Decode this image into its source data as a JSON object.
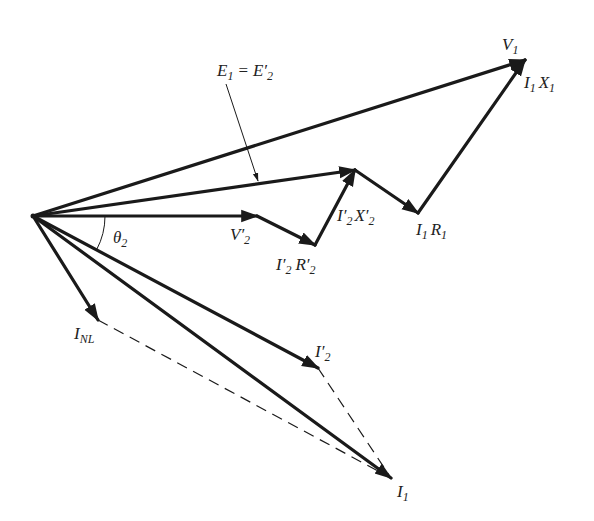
{
  "diagram": {
    "type": "phasor-diagram",
    "colors": {
      "stroke": "#1a1a1a",
      "text": "#222222",
      "background": "#ffffff"
    },
    "origin": [
      33,
      216
    ],
    "phasors": [
      {
        "id": "V1",
        "from": [
          33,
          216
        ],
        "to": [
          525,
          60
        ]
      },
      {
        "id": "E1",
        "from": [
          33,
          216
        ],
        "to": [
          355,
          170
        ]
      },
      {
        "id": "V2p",
        "from": [
          33,
          216
        ],
        "to": [
          257,
          216
        ]
      },
      {
        "id": "I2R2p",
        "from": [
          257,
          216
        ],
        "to": [
          315,
          245
        ]
      },
      {
        "id": "I2X2p",
        "from": [
          315,
          245
        ],
        "to": [
          355,
          170
        ]
      },
      {
        "id": "I1R1",
        "from": [
          355,
          170
        ],
        "to": [
          418,
          213
        ]
      },
      {
        "id": "I1X1",
        "from": [
          418,
          213
        ],
        "to": [
          525,
          60
        ]
      },
      {
        "id": "INL",
        "from": [
          33,
          216
        ],
        "to": [
          98,
          320
        ]
      },
      {
        "id": "I2p",
        "from": [
          33,
          216
        ],
        "to": [
          318,
          368
        ]
      },
      {
        "id": "I1",
        "from": [
          33,
          216
        ],
        "to": [
          391,
          478
        ]
      }
    ],
    "dashed_lines": [
      {
        "id": "INL-to-I1",
        "from": [
          98,
          320
        ],
        "to": [
          391,
          478
        ]
      },
      {
        "id": "I2p-to-I1",
        "from": [
          318,
          368
        ],
        "to": [
          391,
          478
        ]
      }
    ],
    "pointer": {
      "id": "E1-pointer",
      "from": [
        226,
        84
      ],
      "to": [
        258,
        181
      ]
    },
    "angle_arc": {
      "id": "theta2",
      "center": [
        33,
        216
      ],
      "radius": 72,
      "start_deg": 0,
      "end_deg": 28
    }
  },
  "labels": {
    "V1": {
      "main": "V",
      "sub": "1"
    },
    "I1X1": {
      "main1": "I",
      "sub1": "1",
      "main2": "X",
      "sub2": "1"
    },
    "E1": {
      "main1": "E",
      "sub1": "1",
      "eq": "=",
      "main2": "E′",
      "sub2": "2"
    },
    "V2p": {
      "main": "V′",
      "sub": "2"
    },
    "I2R2p": {
      "main1": "I′",
      "sub1": "2",
      "main2": "R′",
      "sub2": "2"
    },
    "I2X2p": {
      "main1": "I′",
      "sub1": "2",
      "main2": "X′",
      "sub2": "2"
    },
    "I1R1": {
      "main1": "I",
      "sub1": "1",
      "main2": "R",
      "sub2": "1"
    },
    "theta2": {
      "main": "θ",
      "sub": "2"
    },
    "INL": {
      "main": "I",
      "sub": "NL"
    },
    "I2p": {
      "main": "I′",
      "sub": "2"
    },
    "I1": {
      "main": "I",
      "sub": "1"
    }
  }
}
